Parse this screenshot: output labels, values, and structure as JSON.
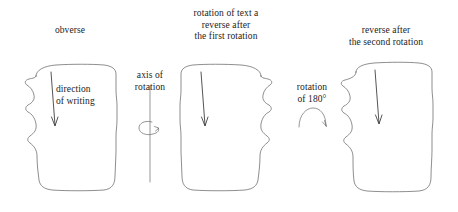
{
  "figure": {
    "type": "diagram",
    "background_color": "#ffffff",
    "outline_color": "#5d5d5d",
    "text_color": "#1c1c1c"
  },
  "headings": {
    "obverse": "obverse",
    "first_rotation": "rotation of text a\nreverse after\nthe first rotation",
    "second_rotation": "reverse after\nthe second rotation"
  },
  "annotations": {
    "direction_of_writing": "direction\nof writing",
    "axis_of_rotation": "axis of\nrotation",
    "rotation_180": "rotation\nof 180°"
  },
  "panels": [
    {
      "name": "obverse-tablet",
      "heading": "obverse",
      "annotation": "direction of writing",
      "has_down_arrow": true
    },
    {
      "name": "first-reverse-tablet",
      "heading": "rotation of text a reverse after the first rotation",
      "annotation": "",
      "has_down_arrow": true
    },
    {
      "name": "second-reverse-tablet",
      "heading": "reverse after the second rotation",
      "annotation": "",
      "has_down_arrow": true
    }
  ],
  "operators": [
    {
      "name": "vertical-axis-rotation",
      "label": "axis of rotation",
      "icon": "vertical-axis-with-spiral-arrow"
    },
    {
      "name": "half-turn-rotation",
      "label": "rotation of 180°",
      "icon": "semicircular-arc-arrow"
    }
  ]
}
